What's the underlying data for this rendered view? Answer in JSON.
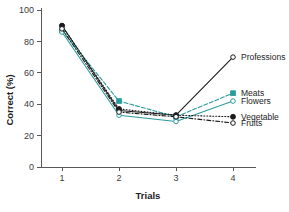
{
  "chart_data": {
    "type": "line",
    "title": "",
    "xlabel": "Trials",
    "ylabel": "Correct (%)",
    "x": [
      1,
      2,
      3,
      4
    ],
    "xtick_labels": [
      "1",
      "2",
      "3",
      "4"
    ],
    "ytick_labels": [
      "0",
      "20",
      "40",
      "60",
      "80",
      "100"
    ],
    "ytick_values": [
      0,
      20,
      40,
      60,
      80,
      100
    ],
    "xlim": [
      0.7,
      4.3
    ],
    "ylim": [
      0,
      100
    ],
    "grid": false,
    "legend_position": "right-inline",
    "colors": {
      "teal": "#2a9b9b",
      "black": "#1b1b1d",
      "axis": "#58585a"
    },
    "series": [
      {
        "name": "Professions",
        "values": [
          90,
          36,
          33,
          70
        ],
        "color": "#1b1b1d",
        "marker": "open-circle",
        "dash": "solid",
        "label_y": 70
      },
      {
        "name": "Meats",
        "values": [
          87,
          42,
          32,
          47
        ],
        "color": "#2a9b9b",
        "marker": "filled-square",
        "dash": "dashed",
        "label_y": 47
      },
      {
        "name": "Flowers",
        "values": [
          86,
          33,
          29,
          42
        ],
        "color": "#2a9b9b",
        "marker": "open-circle",
        "dash": "solid",
        "label_y": 42
      },
      {
        "name": "Vegetable",
        "values": [
          90,
          37,
          33,
          32
        ],
        "color": "#1b1b1d",
        "marker": "filled-circle",
        "dash": "dotted",
        "label_y": 32
      },
      {
        "name": "Fruits",
        "values": [
          88,
          35,
          32,
          28
        ],
        "color": "#1b1b1d",
        "marker": "open-circle",
        "dash": "dashdot",
        "label_y": 28
      }
    ]
  }
}
